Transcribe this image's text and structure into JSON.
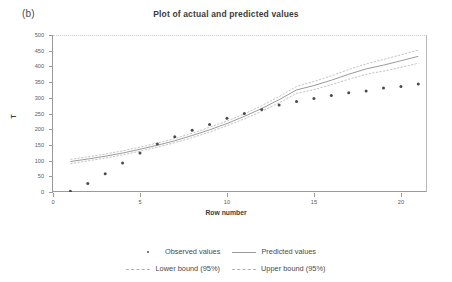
{
  "figure": {
    "panel_label": "(b)",
    "title": "Plot of actual and predicted values"
  },
  "axes": {
    "x_title": "Row number",
    "y_title": "T",
    "x_ticks": [
      "0",
      "5",
      "10",
      "15",
      "20"
    ],
    "y_ticks": [
      "0",
      "50",
      "100",
      "150",
      "200",
      "250",
      "300",
      "350",
      "400",
      "450",
      "500"
    ]
  },
  "legend": {
    "rows": [
      [
        {
          "label": "Observed values",
          "marker": "dot"
        },
        {
          "label": "Predicted values",
          "marker": "solid-line"
        }
      ],
      [
        {
          "label": "Lower bound (95%)",
          "marker": "dashed-line"
        },
        {
          "label": "Upper bound (95%)",
          "marker": "dashed-line"
        }
      ]
    ]
  },
  "colors": {
    "marker": "#4a4a4a",
    "predicted_line": "#8e8e8e",
    "bound_line": "#b4b4b4",
    "axis": "#9a9a9a",
    "gridline": "#d8d8d8",
    "text": "#3c3c3c"
  },
  "chart_data": {
    "type": "scatter",
    "title": "Plot of actual and predicted values",
    "xlabel": "Row number",
    "ylabel": "T",
    "xlim": [
      0,
      21.5
    ],
    "ylim": [
      0,
      500
    ],
    "xticks": [
      0,
      5,
      10,
      15,
      20
    ],
    "yticks": [
      0,
      50,
      100,
      150,
      200,
      250,
      300,
      350,
      400,
      450,
      500
    ],
    "grid": false,
    "legend_position": "bottom",
    "x": [
      1,
      2,
      3,
      4,
      5,
      6,
      7,
      8,
      9,
      10,
      11,
      12,
      13,
      14,
      15,
      16,
      17,
      18,
      19,
      20,
      21
    ],
    "series": [
      {
        "name": "Observed values",
        "type": "scatter",
        "marker": "dot",
        "values": [
          2,
          27,
          58,
          92,
          124,
          153,
          176,
          197,
          215,
          235,
          250,
          263,
          277,
          288,
          298,
          307,
          316,
          322,
          331,
          336,
          344
        ]
      },
      {
        "name": "Predicted values",
        "type": "line",
        "style": "solid",
        "values": [
          97,
          105,
          114,
          124,
          136,
          149,
          163,
          180,
          198,
          218,
          241,
          266,
          294,
          325,
          339,
          356,
          375,
          392,
          404,
          418,
          432
        ]
      },
      {
        "name": "Lower bound (95%)",
        "type": "line",
        "style": "dashed",
        "values": [
          90,
          99,
          108,
          118,
          130,
          143,
          157,
          173,
          191,
          211,
          233,
          257,
          284,
          314,
          326,
          342,
          359,
          375,
          385,
          397,
          410
        ]
      },
      {
        "name": "Upper bound (95%)",
        "type": "line",
        "style": "dashed",
        "values": [
          104,
          112,
          121,
          131,
          143,
          156,
          170,
          187,
          206,
          226,
          249,
          275,
          304,
          336,
          352,
          370,
          390,
          408,
          422,
          437,
          452
        ]
      }
    ]
  }
}
